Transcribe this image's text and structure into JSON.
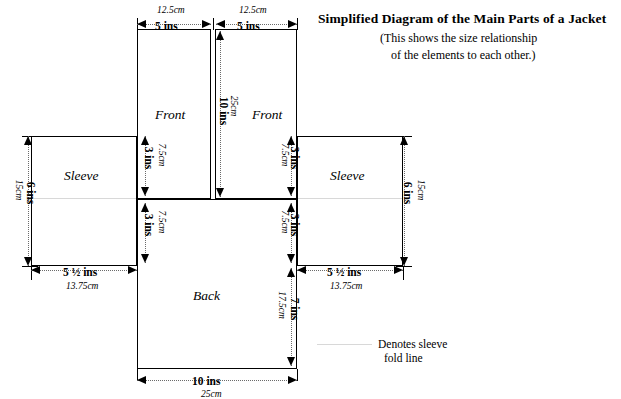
{
  "header": {
    "title": "Simplified Diagram of the Main Parts of a Jacket",
    "subtitle_line1": "(This shows the size relationship",
    "subtitle_line2": "of the elements to each other.)"
  },
  "panels": {
    "front_left": "Front",
    "front_right": "Front",
    "back": "Back",
    "sleeve_left": "Sleeve",
    "sleeve_right": "Sleeve"
  },
  "dimensions": {
    "top_left": {
      "ins": "5 ins",
      "cm": "12.5cm"
    },
    "top_right": {
      "ins": "5 ins",
      "cm": "12.5cm"
    },
    "center_front": {
      "ins": "10 ins",
      "cm": "25cm"
    },
    "front_left_armhole": {
      "ins": "3 ins",
      "cm": "7.5cm"
    },
    "front_right_armhole": {
      "ins": "3 ins",
      "cm": "7.5cm"
    },
    "back_left_armhole": {
      "ins": "3 ins",
      "cm": "7.5cm"
    },
    "back_right_armhole": {
      "ins": "3 ins",
      "cm": "7.5cm"
    },
    "back_height": {
      "ins": "7 ins",
      "cm": "17.5cm"
    },
    "sleeve_left_height": {
      "ins": "6 ins",
      "cm": "15cm"
    },
    "sleeve_right_height": {
      "ins": "6 ins",
      "cm": "15cm"
    },
    "sleeve_left_width": {
      "ins": "5 ½  ins",
      "cm": "13.75cm"
    },
    "sleeve_right_width": {
      "ins": "5 ½  ins",
      "cm": "13.75cm"
    },
    "bottom_width": {
      "ins": "10 ins",
      "cm": "25cm"
    }
  },
  "legend": {
    "line1": "Denotes sleeve",
    "line2": "fold line"
  },
  "colors": {
    "outline": "#000000",
    "fold_line": "#d8d8d8",
    "dimension_rule": "#6b6b6b",
    "background": "#ffffff"
  }
}
